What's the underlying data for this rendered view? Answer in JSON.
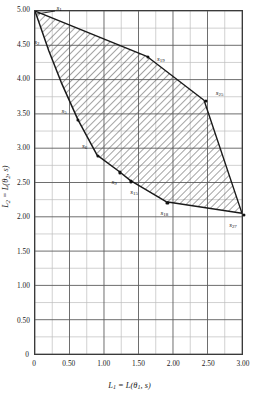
{
  "chart_data": {
    "type": "area",
    "title": "",
    "subtitle": "",
    "xlabel": "L1 = L(theta1, s)",
    "ylabel": "L2 = L(theta2, s)",
    "xlabel_parts": {
      "lead": "L",
      "lead_sub": "1",
      "eq": " = ",
      "fn": "L(",
      "theta": "θ",
      "theta_sub": "1",
      "comma": ", ",
      "arg": "s",
      "close": ")"
    },
    "ylabel_parts": {
      "lead": "L",
      "lead_sub": "2",
      "eq": " = ",
      "fn": "L(",
      "theta": "θ",
      "theta_sub": "2",
      "comma": ", ",
      "arg": "s",
      "close": ")"
    },
    "xlim": [
      0,
      3.0
    ],
    "ylim": [
      0,
      5.0
    ],
    "x_major_ticks": [
      0,
      0.5,
      1.0,
      1.5,
      2.0,
      2.5,
      3.0
    ],
    "x_major_tick_labels": [
      "0",
      "0.50",
      "1.00",
      "1.50",
      "2.00",
      "2.50",
      "3.00"
    ],
    "y_major_ticks": [
      0,
      0.5,
      1.0,
      1.5,
      2.0,
      2.5,
      3.0,
      3.5,
      4.0,
      4.5,
      5.0
    ],
    "y_major_tick_labels": [
      "0",
      "0.50",
      "1.00",
      "1.50",
      "2.00",
      "2.50",
      "3.00",
      "3.50",
      "4.00",
      "4.50",
      "5.00"
    ],
    "x_minor_step": 0.25,
    "y_minor_step": 0.25,
    "grid": true,
    "grid_minor": true,
    "legend": false,
    "legend_position": "none",
    "region_fill": "diagonal-hatch",
    "region_hatch_color": "#4a4a4a",
    "region_outline_color": "#1a1a1a",
    "annotation_note": "Convex risk set bounded above by segment s1-s19-s25-s27 and below by convex curve s1-s2-s5-s6-s9-s15-s18-s27",
    "upper_boundary": [
      {
        "x": 0.0,
        "y": 5.0
      },
      {
        "x": 1.62,
        "y": 4.34
      },
      {
        "x": 2.45,
        "y": 3.7
      },
      {
        "x": 3.0,
        "y": 2.05
      }
    ],
    "lower_boundary": [
      {
        "x": 0.0,
        "y": 5.0
      },
      {
        "x": 0.2,
        "y": 4.42
      },
      {
        "x": 0.38,
        "y": 3.96
      },
      {
        "x": 0.62,
        "y": 3.42
      },
      {
        "x": 0.9,
        "y": 2.9
      },
      {
        "x": 1.22,
        "y": 2.66
      },
      {
        "x": 1.38,
        "y": 2.53
      },
      {
        "x": 1.9,
        "y": 2.22
      },
      {
        "x": 3.0,
        "y": 2.05
      }
    ],
    "labeled_points": [
      {
        "label": "s",
        "sub": "1",
        "x": 0.0,
        "y": 5.0,
        "label_dx": 24,
        "label_dy": -2,
        "dot": false,
        "leader": true
      },
      {
        "label": "s",
        "sub": "2",
        "x": 0.2,
        "y": 4.42,
        "label_dx": -12,
        "label_dy": -8,
        "dot": false,
        "leader": false
      },
      {
        "label": "s",
        "sub": "5",
        "x": 0.62,
        "y": 3.42,
        "label_dx": -14,
        "label_dy": -8,
        "dot": true,
        "leader": false
      },
      {
        "label": "s",
        "sub": "6",
        "x": 0.9,
        "y": 2.9,
        "label_dx": -13,
        "label_dy": -9,
        "dot": true,
        "leader": false
      },
      {
        "label": "s",
        "sub": "9",
        "x": 1.22,
        "y": 2.66,
        "label_dx": -6,
        "label_dy": 11,
        "dot": true,
        "leader": false
      },
      {
        "label": "s",
        "sub": "15",
        "x": 1.38,
        "y": 2.53,
        "label_dx": 3,
        "label_dy": 12,
        "dot": true,
        "leader": false
      },
      {
        "label": "s",
        "sub": "18",
        "x": 1.9,
        "y": 2.22,
        "label_dx": -3,
        "label_dy": 11,
        "dot": true,
        "leader": false
      },
      {
        "label": "s",
        "sub": "19",
        "x": 1.62,
        "y": 4.34,
        "label_dx": 13,
        "label_dy": 3,
        "dot": true,
        "leader": false
      },
      {
        "label": "s",
        "sub": "25",
        "x": 2.45,
        "y": 3.7,
        "label_dx": 14,
        "label_dy": -7,
        "dot": true,
        "leader": false
      },
      {
        "label": "s",
        "sub": "27",
        "x": 3.0,
        "y": 2.05,
        "label_dx": -11,
        "label_dy": 11,
        "dot": true,
        "leader": false
      }
    ]
  }
}
